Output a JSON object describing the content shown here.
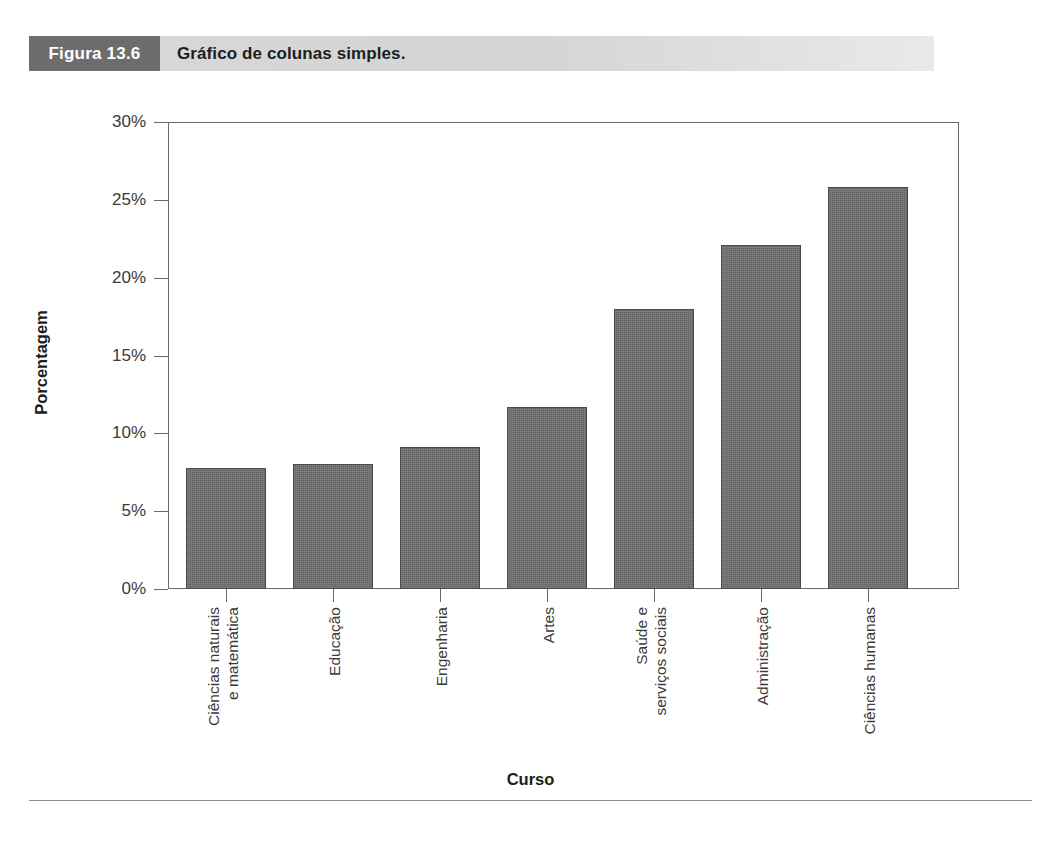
{
  "figure": {
    "tag": "Figura 13.6",
    "caption": "Gráfico de colunas simples."
  },
  "chart_data": {
    "type": "bar",
    "title": "",
    "xlabel": "Curso",
    "ylabel": "Porcentagem",
    "categories": [
      "Ciências naturais\ne matemática",
      "Educação",
      "Engenharia",
      "Artes",
      "Saúde e\nserviços sociais",
      "Administração",
      "Ciências humanas"
    ],
    "values": [
      7.8,
      8.0,
      9.1,
      11.7,
      18.0,
      22.1,
      25.8
    ],
    "ylim": [
      0,
      30
    ],
    "yticks": [
      0,
      5,
      10,
      15,
      20,
      25,
      30
    ],
    "ytick_labels": [
      "0%",
      "5%",
      "10%",
      "15%",
      "20%",
      "25%",
      "30%"
    ],
    "grid": false,
    "legend": null,
    "bar_color": "#6f6f6f",
    "bar_edge_color": "#4a4a4a",
    "axis_color": "#6a6a6a",
    "value_unit": "%"
  }
}
